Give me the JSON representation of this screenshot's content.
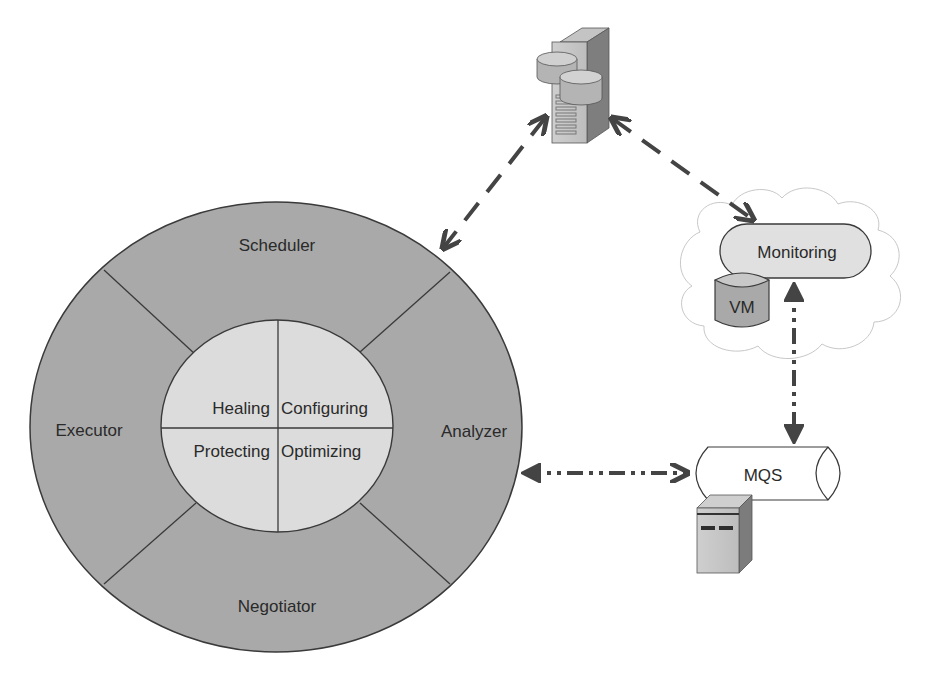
{
  "diagram": {
    "outer_ring": {
      "segments": [
        {
          "id": "scheduler",
          "label": "Scheduler"
        },
        {
          "id": "analyzer",
          "label": "Analyzer"
        },
        {
          "id": "negotiator",
          "label": "Negotiator"
        },
        {
          "id": "executor",
          "label": "Executor"
        }
      ]
    },
    "inner_core": {
      "quadrants": [
        {
          "id": "healing",
          "label": "Healing"
        },
        {
          "id": "configuring",
          "label": "Configuring"
        },
        {
          "id": "protecting",
          "label": "Protecting"
        },
        {
          "id": "optimizing",
          "label": "Optimizing"
        }
      ]
    },
    "nodes": {
      "database_server": {
        "icon": "database-server-icon"
      },
      "monitoring": {
        "label": "Monitoring"
      },
      "vm": {
        "label": "VM"
      },
      "mqs": {
        "label": "MQS"
      },
      "mqs_server": {
        "icon": "server-icon"
      }
    },
    "connections": [
      {
        "from": "database_server",
        "to": "outer_ring",
        "style": "dashed",
        "direction": "bidirectional"
      },
      {
        "from": "database_server",
        "to": "monitoring",
        "style": "dashed",
        "direction": "bidirectional"
      },
      {
        "from": "monitoring",
        "to": "mqs",
        "style": "dash-dot-dot",
        "direction": "bidirectional"
      },
      {
        "from": "outer_ring",
        "to": "mqs",
        "style": "dash-dot-dot",
        "direction": "bidirectional"
      }
    ],
    "colors": {
      "outer_ring": "#a9a9a9",
      "inner_core": "#dcdcdc",
      "stroke": "#3a3a3a",
      "arrow": "#444444",
      "cloud_stroke": "#c8c8c8"
    }
  }
}
